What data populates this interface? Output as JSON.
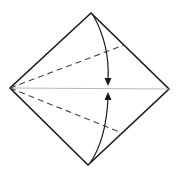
{
  "diagram": {
    "shape": "square-diamond",
    "creases": [
      {
        "id": "center-crease",
        "type": "existing-crease",
        "from": "left-corner",
        "to": "right-corner"
      },
      {
        "id": "upper-valley-fold",
        "type": "valley-fold",
        "from": "left-corner",
        "to": "upper-right-edge"
      },
      {
        "id": "lower-valley-fold",
        "type": "valley-fold",
        "from": "left-corner",
        "to": "lower-right-edge"
      }
    ],
    "arrows": [
      {
        "id": "fold-top-down",
        "from": "top-corner",
        "to": "center-crease",
        "direction": "down"
      },
      {
        "id": "fold-bottom-up",
        "from": "bottom-corner",
        "to": "center-crease",
        "direction": "up"
      }
    ],
    "colors": {
      "outline": "#1a1a1a",
      "crease": "#b8b8b8",
      "valley": "#444444",
      "background": "#ffffff"
    }
  }
}
